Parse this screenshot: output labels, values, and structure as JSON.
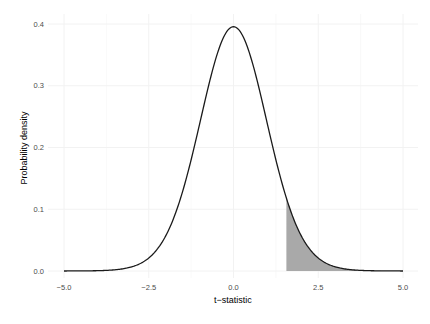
{
  "chart_data": {
    "type": "area",
    "title": "",
    "xlabel": "t−statistic",
    "ylabel": "Probability density",
    "xlim": [
      -5.0,
      5.0
    ],
    "ylim": [
      0.0,
      0.4
    ],
    "x_ticks": [
      "-5.0",
      "-2.5",
      "0.0",
      "2.5",
      "5.0"
    ],
    "y_ticks": [
      "0.0",
      "0.1",
      "0.2",
      "0.3",
      "0.4"
    ],
    "grid": true,
    "legend": "none",
    "series": [
      {
        "name": "t-distribution density",
        "type": "line",
        "distribution": "student_t",
        "df": 30,
        "x_range": [
          -5.0,
          5.0
        ],
        "peak": {
          "x": 0.0,
          "y": 0.396
        },
        "sample_points": [
          {
            "x": -5.0,
            "y": 0.0
          },
          {
            "x": -2.5,
            "y": 0.018
          },
          {
            "x": -1.5,
            "y": 0.128
          },
          {
            "x": 0.0,
            "y": 0.396
          },
          {
            "x": 1.5,
            "y": 0.128
          },
          {
            "x": 2.5,
            "y": 0.018
          },
          {
            "x": 5.0,
            "y": 0.0
          }
        ],
        "color": "#000000"
      },
      {
        "name": "upper-tail shaded region",
        "type": "area",
        "from_x": 1.56,
        "to_x": 5.0,
        "color": "#a6a6a6"
      }
    ]
  },
  "colors": {
    "curve": "#1a1a1a",
    "shade": "#a9a9a9",
    "grid": "#f2f2f2",
    "tick_text": "#4d4d4d"
  }
}
